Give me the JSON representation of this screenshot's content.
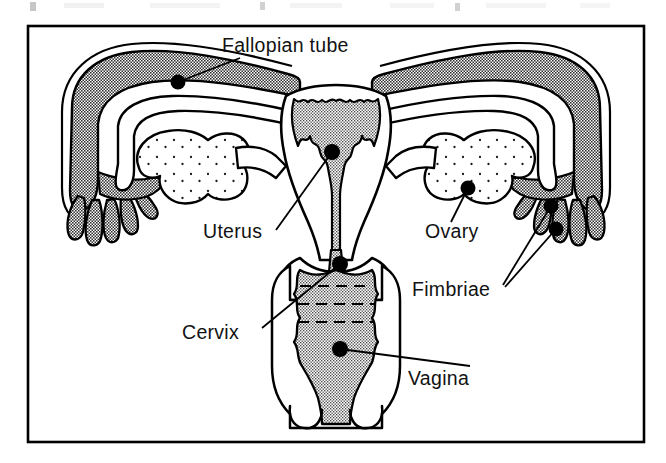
{
  "figure": {
    "frame": {
      "x": 27,
      "y": 25,
      "width": 618,
      "height": 418,
      "border_color": "#000000",
      "background_color": "#ffffff"
    },
    "palette": {
      "outline": "#000000",
      "organ_gray": "#8a8a8a",
      "cavity_gray": "#9a9a9a",
      "vagina_gray": "#a0a0a0",
      "white": "#ffffff",
      "text": "#121212",
      "page_background": "#ffffff"
    },
    "labels": [
      {
        "id": "fallopian-tube",
        "text": "Fallopian tube",
        "text_x": 222,
        "text_y": 52,
        "anchor": "start",
        "marker_x": 178,
        "marker_y": 82,
        "leader": "M 178 82 L 240 58"
      },
      {
        "id": "uterus",
        "text": "Uterus",
        "text_x": 203,
        "text_y": 238,
        "anchor": "start",
        "marker_x": 332,
        "marker_y": 152,
        "leader": "M 332 152 L 276 230"
      },
      {
        "id": "ovary",
        "text": "Ovary",
        "text_x": 425,
        "text_y": 238,
        "anchor": "start",
        "marker_x": 468,
        "marker_y": 188,
        "leader": "M 468 188 L 451 222"
      },
      {
        "id": "fimbriae",
        "text": "Fimbriae",
        "text_x": 412,
        "text_y": 296,
        "anchor": "start",
        "marker_x": 551,
        "marker_y": 206,
        "marker2_x": 556,
        "marker2_y": 229,
        "leader": "M 551 206 L 503 285",
        "leader2": "M 556 229 L 505 287"
      },
      {
        "id": "cervix",
        "text": "Cervix",
        "text_x": 182,
        "text_y": 339,
        "anchor": "start",
        "marker_x": 340,
        "marker_y": 264,
        "leader": "M 340 264 L 262 328"
      },
      {
        "id": "vagina",
        "text": "Vagina",
        "text_x": 408,
        "text_y": 385,
        "anchor": "start",
        "marker_x": 340,
        "marker_y": 349,
        "leader": "M 340 349 L 470 366"
      }
    ],
    "structures": [
      {
        "id": "left-fallopian-tube",
        "name": "Fallopian tube (left)",
        "fill": "organ_gray"
      },
      {
        "id": "right-fallopian-tube",
        "name": "Fallopian tube (right)",
        "fill": "organ_gray"
      },
      {
        "id": "left-fimbriae",
        "name": "Fimbriae (left)",
        "fill": "organ_gray"
      },
      {
        "id": "right-fimbriae",
        "name": "Fimbriae (right)",
        "fill": "organ_gray"
      },
      {
        "id": "left-ovary",
        "name": "Ovary (left)",
        "fill": "white",
        "texture": "stipple"
      },
      {
        "id": "right-ovary",
        "name": "Ovary (right)",
        "fill": "white",
        "texture": "stipple"
      },
      {
        "id": "uterus-body",
        "name": "Uterus body",
        "fill": "white"
      },
      {
        "id": "uterine-cavity",
        "name": "Uterine cavity / endometrium",
        "fill": "cavity_gray",
        "texture": "serrated-edge"
      },
      {
        "id": "cervical-canal",
        "name": "Cervical canal",
        "fill": "cavity_gray"
      },
      {
        "id": "cervix-structure",
        "name": "Cervix",
        "fill": "white"
      },
      {
        "id": "vaginal-canal",
        "name": "Vagina",
        "fill": "vagina_gray",
        "texture": "rugae-dashed"
      },
      {
        "id": "vaginal-opening",
        "name": "Vaginal opening / labia",
        "fill": "white"
      }
    ]
  }
}
